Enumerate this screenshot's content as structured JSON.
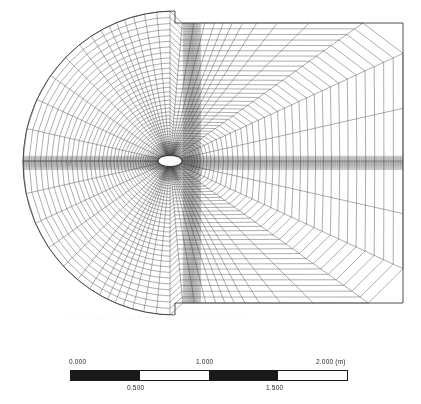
{
  "view": {
    "background": "#ffffff",
    "mesh_color": "#4a4a4a",
    "body_fill": "#ffffff",
    "watermark_text": "ANSYS Mesh Quadrilateral Dominant Elements",
    "watermark_color": "#fbfbfb"
  },
  "scale_bar": {
    "unit_label": "(m)",
    "bar_color": "#1a1a1a",
    "top_labels": [
      "0.000",
      "1.000",
      "2.000 (m)"
    ],
    "bottom_labels": [
      "0.500",
      "1.500"
    ],
    "segments": [
      "fill",
      "blank",
      "fill",
      "blank"
    ],
    "min": 0.0,
    "max": 2.0,
    "step": 0.5
  },
  "chart_data": {
    "type": "mesh",
    "title": "",
    "domain": {
      "shape": "D-shaped: semicircular upstream (left) cap, rectangular downstream (right) block",
      "x_range_m": [
        0.0,
        2.0
      ],
      "y_range_m": [
        0.0,
        2.0
      ],
      "left_arc_center_px": [
        175,
        163
      ],
      "left_arc_radius_px": 152,
      "right_edge_px": 403,
      "top_edge_px": 23,
      "bottom_edge_px": 303
    },
    "body": {
      "type": "ellipse",
      "center_px": [
        170,
        161
      ],
      "semi_major_px": 12,
      "semi_minor_px": 5.5,
      "fill": "#ffffff",
      "outline": "#1a1a1a"
    },
    "refinement_bands": [
      {
        "name": "wake-horizontal-band",
        "orientation": "horizontal",
        "center_px": 163,
        "half_width_px": 7,
        "density": "high"
      },
      {
        "name": "vertical-centerline-band",
        "orientation": "vertical",
        "center_px": 192,
        "half_width_px": 9,
        "density": "high"
      }
    ],
    "grid_lines_radial": 56,
    "grid_lines_circumferential": 42,
    "element_type": "quadrilateral",
    "xlabel": "",
    "ylabel": ""
  }
}
